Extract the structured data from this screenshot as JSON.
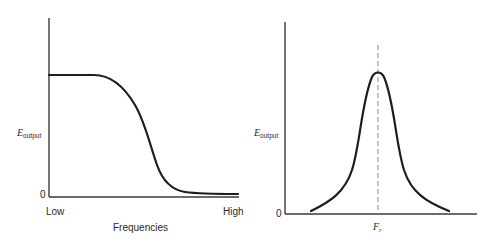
{
  "figures": {
    "lowpass": {
      "y_label_main": "E",
      "y_label_sub": "output",
      "origin_label": "0",
      "x_low_label": "Low",
      "x_high_label": "High",
      "x_title": "Frequencies",
      "curve": "low-pass response: flat high output at low frequencies, falling off to near zero at high frequencies"
    },
    "resonance": {
      "y_label_main": "E",
      "y_label_sub": "output",
      "origin_label": "0",
      "center_label_main": "F",
      "center_label_sub": "r",
      "curve": "resonance (band-pass) peak centered at F_r with dashed vertical line marking resonant frequency"
    }
  },
  "colors": {
    "line": "#1e1e1e",
    "axis": "#3a3a3a",
    "dashed": "#8a8a8a",
    "background": "#ffffff"
  }
}
